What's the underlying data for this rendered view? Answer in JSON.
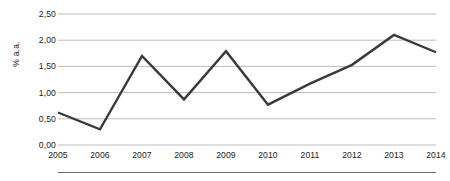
{
  "chart_data": {
    "type": "line",
    "title": "",
    "subtitle": "",
    "xlabel": "",
    "ylabel": "% a.a.",
    "categories": [
      "2005",
      "2006",
      "2007",
      "2008",
      "2009",
      "2010",
      "2011",
      "2012",
      "2013",
      "2014"
    ],
    "x": [
      2005,
      2006,
      2007,
      2008,
      2009,
      2010,
      2011,
      2012,
      2013,
      2014
    ],
    "values": [
      0.62,
      0.3,
      1.7,
      0.87,
      1.79,
      0.77,
      1.17,
      1.53,
      2.1,
      1.77
    ],
    "series": [
      {
        "name": "% a.a.",
        "values": [
          0.62,
          0.3,
          1.7,
          0.87,
          1.79,
          0.77,
          1.17,
          1.53,
          2.1,
          1.77
        ]
      }
    ],
    "ylim": [
      0.0,
      2.5
    ],
    "y_ticks": [
      0.0,
      0.5,
      1.0,
      1.5,
      2.0,
      2.5
    ],
    "y_tick_labels": [
      "0,00",
      "0,50",
      "1,00",
      "1,50",
      "2,00",
      "2,50"
    ],
    "x_tick_labels": [
      "2005",
      "2006",
      "2007",
      "2008",
      "2009",
      "2010",
      "2011",
      "2012",
      "2013",
      "2014"
    ],
    "grid": true,
    "grid_axis": "y",
    "legend": false,
    "legend_position": "none",
    "markers": false,
    "annotations": []
  },
  "style": {
    "line_color": "#3a3a3a",
    "grid_color": "#b3b3b3",
    "text_color": "#1a1a1a",
    "rule_color": "#6b6b6b",
    "background": "#ffffff"
  }
}
